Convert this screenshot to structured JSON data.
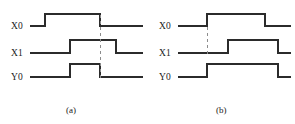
{
  "figure": {
    "type": "timing-diagram",
    "panels": [
      {
        "id": "a",
        "caption": "(a)",
        "signals": [
          {
            "name": "X0",
            "label": "X0",
            "baseline_y": 26,
            "high_y": 14,
            "start_x": 30,
            "end_x": 143,
            "transitions": [
              {
                "x": 45,
                "edge": "rise"
              },
              {
                "x": 100,
                "edge": "fall"
              }
            ]
          },
          {
            "name": "X1",
            "label": "X1",
            "baseline_y": 53,
            "high_y": 40,
            "start_x": 30,
            "end_x": 143,
            "transitions": [
              {
                "x": 70,
                "edge": "rise"
              },
              {
                "x": 116,
                "edge": "fall"
              }
            ]
          },
          {
            "name": "Y0",
            "label": "Y0",
            "baseline_y": 77,
            "high_y": 64,
            "start_x": 30,
            "end_x": 143,
            "transitions": [
              {
                "x": 70,
                "edge": "rise"
              },
              {
                "x": 100,
                "edge": "fall"
              }
            ]
          }
        ],
        "markers": [
          {
            "x": 100,
            "y1": 15,
            "y2": 78,
            "style": "dashed"
          }
        ]
      },
      {
        "id": "b",
        "caption": "(b)",
        "signals": [
          {
            "name": "X0",
            "label": "X0",
            "baseline_y": 26,
            "high_y": 14,
            "start_x": 30,
            "end_x": 143,
            "transitions": [
              {
                "x": 59,
                "edge": "rise"
              },
              {
                "x": 117,
                "edge": "fall"
              }
            ]
          },
          {
            "name": "X1",
            "label": "X1",
            "baseline_y": 53,
            "high_y": 40,
            "start_x": 30,
            "end_x": 143,
            "transitions": [
              {
                "x": 80,
                "edge": "rise"
              },
              {
                "x": 130,
                "edge": "fall"
              }
            ]
          },
          {
            "name": "Y0",
            "label": "Y0",
            "baseline_y": 77,
            "high_y": 64,
            "start_x": 30,
            "end_x": 143,
            "transitions": [
              {
                "x": 59,
                "edge": "rise"
              },
              {
                "x": 130,
                "edge": "fall"
              }
            ]
          }
        ],
        "markers": [
          {
            "x": 59,
            "y1": 27,
            "y2": 56,
            "style": "dashed"
          }
        ]
      }
    ],
    "colors": {
      "trace": "#2b2b2b",
      "marker": "#8c8c8c",
      "background": "#ffffff",
      "text": "#1a1a1a"
    }
  }
}
